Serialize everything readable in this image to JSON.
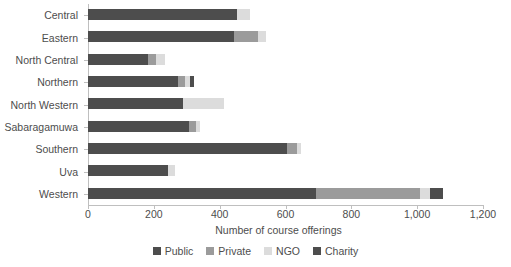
{
  "chart_data": {
    "type": "bar",
    "orientation": "horizontal",
    "stacked": true,
    "title": "",
    "xlabel": "Number of course offerings",
    "ylabel": "",
    "xlim": [
      0,
      1200
    ],
    "xticks": [
      0,
      200,
      400,
      600,
      800,
      1000,
      1200
    ],
    "xticklabels": [
      "0",
      "200",
      "400",
      "600",
      "800",
      "1,000",
      "1,200"
    ],
    "grid": false,
    "legend_position": "bottom",
    "categories": [
      "Central",
      "Eastern",
      "North Central",
      "Northern",
      "North Western",
      "Sabaragamuwa",
      "Southern",
      "Uva",
      "Western"
    ],
    "series": [
      {
        "name": "Public",
        "color": "#4d4d4d",
        "values": [
          453,
          443,
          182,
          272,
          288,
          307,
          604,
          243,
          693
        ]
      },
      {
        "name": "Private",
        "color": "#9b9b9b",
        "values": [
          0,
          73,
          25,
          24,
          0,
          22,
          30,
          0,
          317
        ]
      },
      {
        "name": "NGO",
        "color": "#dcdcdc",
        "values": [
          39,
          24,
          27,
          14,
          124,
          12,
          14,
          22,
          30
        ]
      },
      {
        "name": "Charity",
        "color": "#4d4d4d",
        "values": [
          0,
          0,
          0,
          13,
          0,
          0,
          0,
          0,
          40
        ]
      }
    ]
  },
  "legend": {
    "items": [
      {
        "label": "Public",
        "color": "#4d4d4d"
      },
      {
        "label": "Private",
        "color": "#9b9b9b"
      },
      {
        "label": "NGO",
        "color": "#dcdcdc"
      },
      {
        "label": "Charity",
        "color": "#4d4d4d"
      }
    ]
  },
  "axis": {
    "x_title": "Number of course offerings"
  }
}
